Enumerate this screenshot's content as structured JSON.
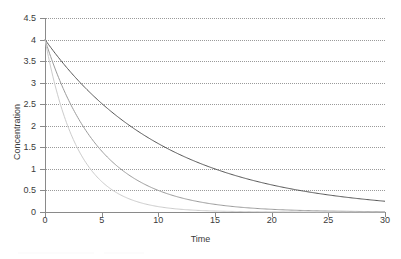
{
  "chart_data": {
    "type": "line",
    "title": "",
    "xlabel": "Time",
    "ylabel": "Concentration",
    "xlim": [
      0,
      30
    ],
    "ylim": [
      0,
      4.5
    ],
    "grid": true,
    "grid_axis": "y",
    "grid_style": "dotted",
    "legend": "none",
    "xticks": [
      0,
      5,
      10,
      15,
      20,
      25,
      30
    ],
    "xtick_labels": [
      "0",
      "5",
      "10",
      "15",
      "20",
      "25",
      "30"
    ],
    "yticks": [
      0,
      0.5,
      1,
      1.5,
      2,
      2.5,
      3,
      3.5,
      4,
      4.5
    ],
    "ytick_labels": [
      "0",
      "0.5",
      "1",
      "1.5",
      "2",
      "2.5",
      "3",
      "3.5",
      "4",
      "4.5"
    ],
    "series": [
      {
        "name": "slow decay",
        "color": "#555555",
        "model": "exponential-decay",
        "c0": 4,
        "k": 0.0925,
        "x": [
          0,
          1,
          2,
          3,
          4,
          5,
          6,
          7,
          8,
          9,
          10,
          11,
          12,
          13,
          14,
          15,
          16,
          17,
          18,
          19,
          20,
          21,
          22,
          23,
          24,
          25,
          26,
          27,
          28,
          29,
          30
        ],
        "values": [
          4.0,
          3.65,
          3.32,
          3.03,
          2.76,
          2.52,
          2.3,
          2.09,
          1.91,
          1.74,
          1.59,
          1.45,
          1.32,
          1.2,
          1.1,
          1.0,
          0.91,
          0.83,
          0.76,
          0.69,
          0.63,
          0.57,
          0.52,
          0.48,
          0.43,
          0.4,
          0.36,
          0.33,
          0.3,
          0.27,
          0.25
        ]
      },
      {
        "name": "medium decay",
        "color": "#9b9b9b",
        "model": "exponential-decay",
        "c0": 4,
        "k": 0.2079,
        "x": [
          0,
          1,
          2,
          3,
          4,
          5,
          6,
          7,
          8,
          9,
          10,
          11,
          12,
          13,
          14,
          15,
          16,
          17,
          18,
          19,
          20,
          21,
          22,
          23,
          24,
          25,
          26,
          27,
          28,
          29,
          30
        ],
        "values": [
          4.0,
          3.25,
          2.64,
          2.14,
          1.74,
          1.41,
          1.15,
          0.93,
          0.76,
          0.62,
          0.5,
          0.41,
          0.33,
          0.27,
          0.22,
          0.18,
          0.14,
          0.12,
          0.09,
          0.08,
          0.06,
          0.05,
          0.04,
          0.03,
          0.03,
          0.02,
          0.02,
          0.01,
          0.01,
          0.01,
          0.01
        ]
      },
      {
        "name": "fast decay",
        "color": "#cccccc",
        "model": "exponential-decay",
        "c0": 4,
        "k": 0.3466,
        "x": [
          0,
          1,
          2,
          3,
          4,
          5,
          6,
          7,
          8,
          9,
          10,
          11,
          12,
          13,
          14,
          15,
          16,
          17,
          18,
          19,
          20,
          21,
          22,
          23,
          24,
          25,
          26,
          27,
          28,
          29,
          30
        ],
        "values": [
          4.0,
          2.83,
          2.0,
          1.41,
          1.0,
          0.71,
          0.5,
          0.35,
          0.25,
          0.18,
          0.125,
          0.088,
          0.063,
          0.044,
          0.031,
          0.022,
          0.016,
          0.011,
          0.008,
          0.006,
          0.004,
          0.003,
          0.002,
          0.0015,
          0.001,
          0.0008,
          0.0005,
          0.0004,
          0.0003,
          0.0002,
          0.0001
        ]
      }
    ]
  },
  "axes": {
    "axis_color": "#8a8a8a",
    "grid_color": "#9a9a9a",
    "text_color": "#3a3a3a"
  }
}
